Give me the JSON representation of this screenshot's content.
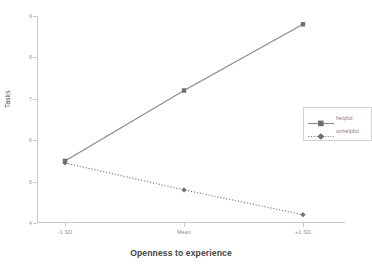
{
  "chart_data": {
    "type": "line",
    "title": "",
    "xlabel": "Openness to experience",
    "ylabel": "Tasks",
    "categories": [
      "-1 SD",
      "Mean",
      "+1 SD"
    ],
    "yticks": [
      "4",
      "5",
      "6",
      "7",
      "8",
      "9"
    ],
    "ylim": [
      4,
      9
    ],
    "grid": false,
    "legend_position": "right-middle",
    "series": [
      {
        "name": "helpful",
        "values": [
          5.5,
          7.2,
          8.8
        ],
        "linestyle": "solid",
        "marker": "square",
        "color": "#8a8a8a"
      },
      {
        "name": "unhelpful",
        "values": [
          5.45,
          4.8,
          4.2
        ],
        "linestyle": "dotted",
        "marker": "diamond",
        "color": "#8a8a8a"
      }
    ]
  },
  "axes": {
    "y_title": "Tasks",
    "x_title": "Openness to experience"
  },
  "legend": {
    "entries": [
      {
        "label": "helpful"
      },
      {
        "label": "unhelpful"
      }
    ]
  },
  "caption": {
    "fragment": ""
  },
  "colors": {
    "series": "#8a8a8a",
    "axis": "#c9c9c9",
    "tick_text": "#9a9a9a",
    "title_text": "#3f3f3f"
  }
}
